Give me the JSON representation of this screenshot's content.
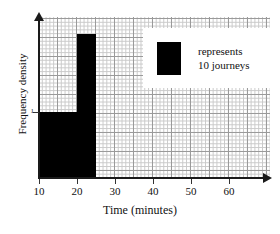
{
  "chart_data": {
    "type": "bar",
    "title": "",
    "subtitle": "",
    "xlabel": "Time (minutes)",
    "ylabel": "Frequency density",
    "xlim": [
      10,
      70
    ],
    "ylim": [
      0,
      2.9
    ],
    "grid": true,
    "grid_style": "graph-paper, minor squares with darker major lines every 5 squares",
    "legend_position": "top-right",
    "bar_color": "#000000",
    "axis_color": "#1a1a1a",
    "x_ticks": [
      {
        "value": 10,
        "label": "10"
      },
      {
        "value": 20,
        "label": "20"
      },
      {
        "value": 30,
        "label": "30"
      },
      {
        "value": 40,
        "label": "40"
      },
      {
        "value": 50,
        "label": "50"
      },
      {
        "value": 60,
        "label": "60"
      }
    ],
    "y_ticks": [
      {
        "value": 1,
        "label": "1"
      }
    ],
    "bars": [
      {
        "x_start": 10,
        "x_end": 20,
        "height": 1.0,
        "width": 10,
        "frequency": 10
      },
      {
        "x_start": 20,
        "x_end": 25,
        "height": 2.2,
        "width": 5,
        "frequency": 11
      }
    ],
    "legend": {
      "swatch_color": "#000000",
      "line1": "represents",
      "line2": "10 journeys"
    },
    "annotations": []
  },
  "figure": {
    "top_sliver_text": ""
  }
}
